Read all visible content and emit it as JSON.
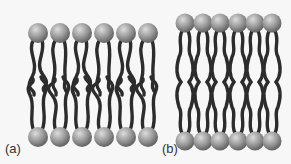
{
  "figure": {
    "panels": [
      {
        "id": "a",
        "label": "(a)",
        "description": "Lipid bilayer with disordered, kinked hydrocarbon tails",
        "heads_per_leaflet": 6,
        "state": "disordered"
      },
      {
        "id": "b",
        "label": "(b)",
        "description": "Lipid bilayer with tightly packed, ordered hydrocarbon tails",
        "heads_per_leaflet": 6,
        "state": "ordered"
      }
    ],
    "colors": {
      "background": "#f7f7f7",
      "head_light": "#d8d8d8",
      "head_dark": "#6a6a6a",
      "tail": "#2c2c2c",
      "label": "#333333"
    }
  }
}
